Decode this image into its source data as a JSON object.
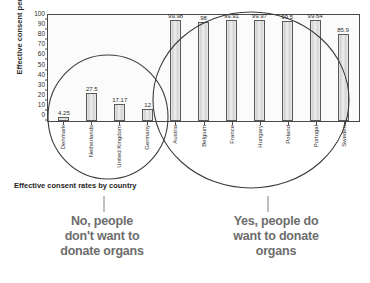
{
  "chart_data": {
    "type": "bar",
    "title": "",
    "caption": "Effective consent rates by country",
    "xlabel": "",
    "ylabel": "Effective consent percentage",
    "ylim": [
      0,
      105
    ],
    "yticks": [
      0,
      10,
      20,
      30,
      40,
      50,
      60,
      70,
      80,
      90,
      100
    ],
    "grid": false,
    "legend": "none",
    "categories": [
      "Denmark",
      "Netherlands",
      "United Kingdom",
      "Germany",
      "Austria",
      "Belgium",
      "France",
      "Hungary",
      "Poland",
      "Portugal",
      "Sweden"
    ],
    "values": [
      4.25,
      27.5,
      17.17,
      12,
      99.98,
      98,
      99.91,
      99.97,
      99.5,
      99.64,
      85.9
    ],
    "value_labels": [
      "4.25",
      "27.5",
      "17.17",
      "12",
      "99.98",
      "98",
      "99.91",
      "99.97",
      "99.5",
      "99.64",
      "85.9"
    ],
    "annotations": [
      {
        "id": "opt-in-group",
        "text": "No, people\ndon't want to\ndonate organs",
        "lines": [
          "No, people",
          "don't want to",
          "donate organs"
        ],
        "covers": [
          "Denmark",
          "Netherlands",
          "United Kingdom",
          "Germany"
        ]
      },
      {
        "id": "opt-out-group",
        "text": "Yes, people do\nwant to donate\norgans",
        "lines": [
          "Yes, people do",
          "want to donate",
          "organs"
        ],
        "covers": [
          "Austria",
          "Belgium",
          "France",
          "Hungary",
          "Poland",
          "Portugal",
          "Sweden"
        ]
      }
    ]
  },
  "colors": {
    "bar_fill": "#dcdcdc",
    "bar_stroke": "#5a5a5a",
    "axis": "#4a4a4a",
    "annotation_text": "#6d6d6d",
    "caption_text": "#1e1e1e",
    "circle_stroke": "#3c3c3c"
  }
}
